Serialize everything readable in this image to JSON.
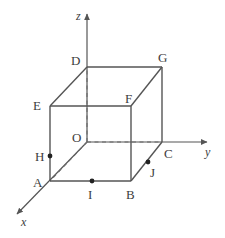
{
  "figure": {
    "type": "3d-cube-coordinate-diagram",
    "background_color": "#ffffff",
    "stroke_color": "#555555",
    "dashed_color": "#6b6b6b",
    "label_color": "#3d3d3d",
    "axes": [
      {
        "name": "z",
        "label": "z",
        "label_x": 76,
        "label_y": 10,
        "from_x": 87,
        "from_y": 142,
        "to_x": 87,
        "to_y": 14
      },
      {
        "name": "y",
        "label": "y",
        "label_x": 205,
        "label_y": 146,
        "from_x": 87,
        "from_y": 142,
        "to_x": 207,
        "to_y": 142
      },
      {
        "name": "x",
        "label": "x",
        "label_x": 21,
        "label_y": 216,
        "from_x": 87,
        "from_y": 142,
        "to_x": 17,
        "to_y": 214
      }
    ],
    "vertices": [
      {
        "name": "O",
        "label": "O",
        "px": 87,
        "py": 142,
        "label_x": 72,
        "label_y": 131,
        "dot": false
      },
      {
        "name": "A",
        "label": "A",
        "px": 50,
        "py": 181,
        "label_x": 33,
        "label_y": 176,
        "dot": false
      },
      {
        "name": "B",
        "label": "B",
        "px": 131,
        "py": 181,
        "label_x": 126,
        "label_y": 188,
        "dot": false
      },
      {
        "name": "C",
        "label": "C",
        "px": 162,
        "py": 142,
        "label_x": 164,
        "label_y": 147,
        "dot": false
      },
      {
        "name": "D",
        "label": "D",
        "px": 87,
        "py": 67,
        "label_x": 71,
        "label_y": 54,
        "dot": false
      },
      {
        "name": "E",
        "label": "E",
        "px": 50,
        "py": 106,
        "label_x": 33,
        "label_y": 99,
        "dot": false
      },
      {
        "name": "F",
        "label": "F",
        "px": 131,
        "py": 106,
        "label_x": 125,
        "label_y": 92,
        "dot": false
      },
      {
        "name": "G",
        "label": "G",
        "px": 162,
        "py": 67,
        "label_x": 158,
        "label_y": 51,
        "dot": false
      },
      {
        "name": "H",
        "label": "H",
        "px": 50,
        "py": 156,
        "label_x": 35,
        "label_y": 150,
        "dot": true
      },
      {
        "name": "I",
        "label": "I",
        "px": 92,
        "py": 181,
        "label_x": 88,
        "label_y": 188,
        "dot": true
      },
      {
        "name": "J",
        "label": "J",
        "px": 148,
        "py": 162,
        "label_x": 150,
        "label_y": 166,
        "dot": true
      }
    ],
    "solid_edges": [
      {
        "name": "edge-A-B",
        "x1": 50,
        "y1": 181,
        "x2": 131,
        "y2": 181
      },
      {
        "name": "edge-B-C",
        "x1": 131,
        "y1": 181,
        "x2": 162,
        "y2": 142
      },
      {
        "name": "edge-A-E",
        "x1": 50,
        "y1": 181,
        "x2": 50,
        "y2": 106
      },
      {
        "name": "edge-B-F",
        "x1": 131,
        "y1": 181,
        "x2": 131,
        "y2": 106
      },
      {
        "name": "edge-C-G",
        "x1": 162,
        "y1": 142,
        "x2": 162,
        "y2": 67
      },
      {
        "name": "edge-E-F",
        "x1": 50,
        "y1": 106,
        "x2": 131,
        "y2": 106
      },
      {
        "name": "edge-F-G",
        "x1": 131,
        "y1": 106,
        "x2": 162,
        "y2": 67
      },
      {
        "name": "edge-E-D",
        "x1": 50,
        "y1": 106,
        "x2": 87,
        "y2": 67
      },
      {
        "name": "edge-D-G",
        "x1": 87,
        "y1": 67,
        "x2": 162,
        "y2": 67
      }
    ],
    "dashed_edges": [
      {
        "name": "edge-O-A-hidden",
        "x1": 87,
        "y1": 142,
        "x2": 50,
        "y2": 181
      },
      {
        "name": "edge-O-C-hidden",
        "x1": 87,
        "y1": 142,
        "x2": 162,
        "y2": 142
      },
      {
        "name": "edge-O-D-hidden",
        "x1": 87,
        "y1": 142,
        "x2": 87,
        "y2": 67
      }
    ]
  }
}
